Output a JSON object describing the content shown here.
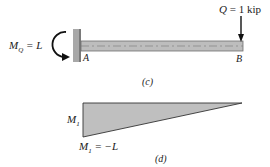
{
  "figure_c": {
    "caption": "(c)",
    "moment_label": {
      "symbol": "M",
      "subscript": "Q",
      "rest": " = L"
    },
    "load_label": {
      "symbol": "Q",
      "rest": " = 1 kip"
    },
    "support_label": "A",
    "free_end_label": "B",
    "colors": {
      "beam_fill": "#bdbdbd",
      "beam_edge": "#6e6e6e",
      "wall": "#a8a8a8",
      "arrow": "#111111"
    }
  },
  "figure_d": {
    "caption": "(d)",
    "ordinate_label": {
      "symbol": "M",
      "subscript": "1"
    },
    "value_label": {
      "symbol": "M",
      "subscript": "1",
      "rest": " = −L"
    },
    "colors": {
      "fill": "#bfbfbf",
      "edge": "#333333"
    }
  }
}
